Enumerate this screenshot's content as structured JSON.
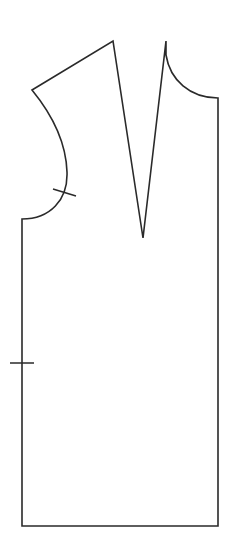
{
  "diagram": {
    "type": "sewing-pattern",
    "stroke_color": "#2a2a2a",
    "background_color": "#ffffff",
    "pieces": [
      {
        "name": "bodice-front",
        "points": {
          "shoulder_outer": [
            32,
            90
          ],
          "dart_left_top": [
            113,
            41
          ],
          "dart_apex": [
            143,
            238
          ],
          "dart_right_top": [
            166,
            41
          ],
          "neck_point": [
            166,
            55
          ],
          "center_front_top": [
            218,
            98
          ],
          "center_front_bottom": [
            218,
            526
          ],
          "side_bottom": [
            22,
            526
          ],
          "underarm": [
            22,
            219
          ]
        },
        "notches": [
          {
            "name": "armhole-notch",
            "from": [
              53,
              189
            ],
            "to": [
              76,
              196
            ]
          },
          {
            "name": "side-notch",
            "from": [
              10,
              363
            ],
            "to": [
              34,
              363
            ]
          }
        ]
      }
    ]
  }
}
